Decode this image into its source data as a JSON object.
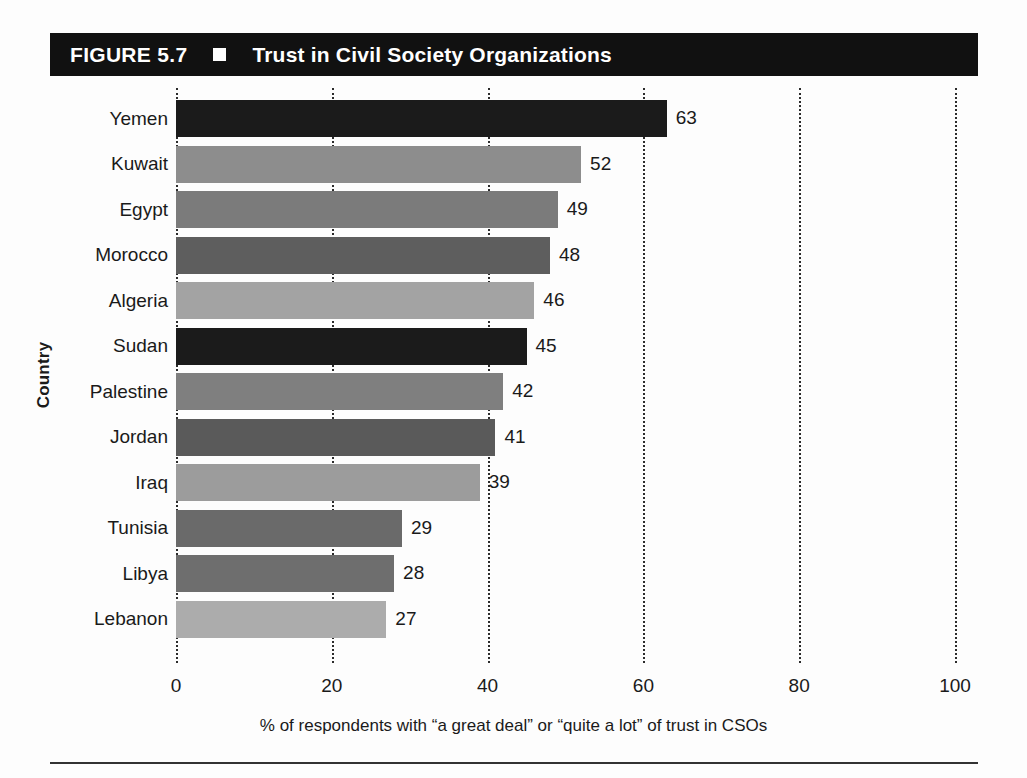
{
  "figure": {
    "number_label": "FIGURE 5.7",
    "marker_icon": "filled-square-icon",
    "title": "Trust in Civil Society Organizations"
  },
  "axes": {
    "y_title": "Country",
    "x_caption": "% of respondents with “a great deal” or “quite a lot” of trust in CSOs",
    "x_ticks": [
      "0",
      "20",
      "40",
      "60",
      "80",
      "100"
    ]
  },
  "bottom_rule": true,
  "chart_data": {
    "type": "bar",
    "orientation": "horizontal",
    "title": "Trust in Civil Society Organizations",
    "xlabel": "% of respondents with “a great deal” or “quite a lot” of trust in CSOs",
    "ylabel": "Country",
    "xlim": [
      0,
      100
    ],
    "xticks": [
      0,
      20,
      40,
      60,
      80,
      100
    ],
    "grid": "vertical-dotted",
    "legend": "none",
    "categories": [
      "Yemen",
      "Kuwait",
      "Egypt",
      "Morocco",
      "Algeria",
      "Sudan",
      "Palestine",
      "Jordan",
      "Iraq",
      "Tunisia",
      "Libya",
      "Lebanon"
    ],
    "values": [
      63,
      52,
      49,
      48,
      46,
      45,
      42,
      41,
      39,
      29,
      28,
      27
    ],
    "value_labels": [
      "63",
      "52",
      "49",
      "48",
      "46",
      "45",
      "42",
      "41",
      "39",
      "29",
      "28",
      "27"
    ],
    "bar_colors": [
      "#1b1b1b",
      "#8d8d8d",
      "#7b7b7b",
      "#5e5e5e",
      "#a3a3a3",
      "#1b1b1b",
      "#7f7f7f",
      "#5a5a5a",
      "#9c9c9c",
      "#6a6a6a",
      "#6e6e6e",
      "#acacac"
    ],
    "bars": [
      {
        "category": "Yemen",
        "value": 63,
        "label": "63",
        "color": "#1b1b1b"
      },
      {
        "category": "Kuwait",
        "value": 52,
        "label": "52",
        "color": "#8d8d8d"
      },
      {
        "category": "Egypt",
        "value": 49,
        "label": "49",
        "color": "#7b7b7b"
      },
      {
        "category": "Morocco",
        "value": 48,
        "label": "48",
        "color": "#5e5e5e"
      },
      {
        "category": "Algeria",
        "value": 46,
        "label": "46",
        "color": "#a3a3a3"
      },
      {
        "category": "Sudan",
        "value": 45,
        "label": "45",
        "color": "#1b1b1b"
      },
      {
        "category": "Palestine",
        "value": 42,
        "label": "42",
        "color": "#7f7f7f"
      },
      {
        "category": "Jordan",
        "value": 41,
        "label": "41",
        "color": "#5a5a5a"
      },
      {
        "category": "Iraq",
        "value": 39,
        "label": "39",
        "color": "#9c9c9c"
      },
      {
        "category": "Tunisia",
        "value": 29,
        "label": "29",
        "color": "#6a6a6a"
      },
      {
        "category": "Libya",
        "value": 28,
        "label": "28",
        "color": "#6e6e6e"
      },
      {
        "category": "Lebanon",
        "value": 27,
        "label": "27",
        "color": "#acacac"
      }
    ]
  },
  "colors": {
    "banner_background": "#111111",
    "banner_text": "#ffffff",
    "gridline": "#2b2b2b",
    "page_background": "#fdfdfd",
    "text": "#1a1a1a"
  }
}
